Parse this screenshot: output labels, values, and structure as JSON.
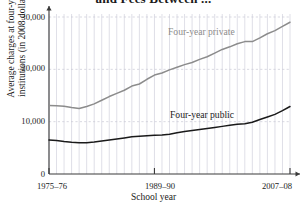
{
  "figure": {
    "title": "and Fees Between ...",
    "xaxis_title": "School year",
    "yaxis_title_line1": "Average charges at four-year",
    "yaxis_title_line2": "institutions (in 2008 dollars)"
  },
  "labels": {
    "private": "Four-year private",
    "public": "Four-year public",
    "y_0": "0",
    "y_10000": "10,000",
    "y_20000": "20,000",
    "y_30000": "30,000",
    "x_start": "1975–76",
    "x_mid": "1989–90",
    "x_end": "2007–08"
  },
  "colors": {
    "private_line": "#8c8c8c",
    "public_line": "#1a1a1a",
    "grid": "#c9c9d6",
    "axis": "#3a3a3a",
    "background": "#ffffff"
  },
  "chart_data": {
    "type": "line",
    "title": "and Fees Between ...",
    "xlabel": "School year",
    "ylabel": "Average charges at four-year institutions (in 2008 dollars)",
    "xlim": [
      1975,
      2007
    ],
    "ylim": [
      0,
      32000
    ],
    "yticks": [
      0,
      10000,
      20000,
      30000
    ],
    "ytick_labels": [
      "0",
      "10,000",
      "20,000",
      "30,000"
    ],
    "xticks": [
      1975,
      1989,
      2007
    ],
    "xtick_labels": [
      "1975–76",
      "1989–90",
      "2007–08"
    ],
    "grid": true,
    "grid_style": "both-axes-dotted",
    "legend": "inline-annotations",
    "x": [
      1975,
      1976,
      1977,
      1978,
      1979,
      1980,
      1981,
      1982,
      1983,
      1984,
      1985,
      1986,
      1987,
      1988,
      1989,
      1990,
      1991,
      1992,
      1993,
      1994,
      1995,
      1996,
      1997,
      1998,
      1999,
      2000,
      2001,
      2002,
      2003,
      2004,
      2005,
      2006,
      2007
    ],
    "series": [
      {
        "name": "Four-year private",
        "color": "#8c8c8c",
        "values": [
          13100,
          13050,
          12950,
          12700,
          12500,
          12900,
          13400,
          14100,
          14800,
          15400,
          16000,
          16800,
          17200,
          18100,
          18900,
          19300,
          19900,
          20400,
          20900,
          21300,
          21900,
          22400,
          23100,
          23800,
          24300,
          24900,
          25300,
          25300,
          26000,
          26800,
          27400,
          28200,
          29000
        ]
      },
      {
        "name": "Four-year public",
        "color": "#1a1a1a",
        "values": [
          6500,
          6400,
          6200,
          6050,
          5950,
          5950,
          6100,
          6300,
          6500,
          6700,
          6900,
          7100,
          7200,
          7300,
          7400,
          7450,
          7600,
          7900,
          8100,
          8300,
          8500,
          8700,
          8900,
          9100,
          9300,
          9500,
          9600,
          9900,
          10400,
          10900,
          11400,
          12100,
          12900
        ]
      }
    ],
    "annotations": [
      {
        "text": "Four-year private",
        "x": 1988,
        "y": 26500
      },
      {
        "text": "Four-year public",
        "x": 1990,
        "y": 14500
      }
    ]
  }
}
